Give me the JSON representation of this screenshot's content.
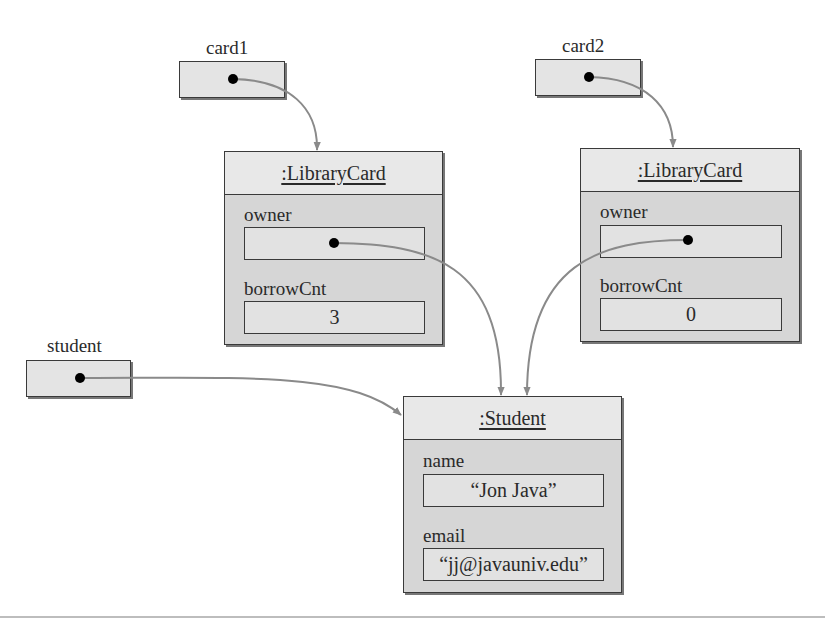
{
  "diagram": {
    "type": "UML object diagram",
    "variables": [
      {
        "id": "card1",
        "label": "card1"
      },
      {
        "id": "card2",
        "label": "card2"
      },
      {
        "id": "student",
        "label": "student"
      }
    ],
    "objects": [
      {
        "id": "librarycard1",
        "title": ":LibraryCard",
        "attributes": [
          {
            "name": "owner",
            "value": ""
          },
          {
            "name": "borrowCnt",
            "value": "3"
          }
        ]
      },
      {
        "id": "librarycard2",
        "title": ":LibraryCard",
        "attributes": [
          {
            "name": "owner",
            "value": ""
          },
          {
            "name": "borrowCnt",
            "value": "0"
          }
        ]
      },
      {
        "id": "student",
        "title": ":Student",
        "attributes": [
          {
            "name": "name",
            "value": "“Jon Java”"
          },
          {
            "name": "email",
            "value": "“jj@javauniv.edu”"
          }
        ]
      }
    ],
    "references": [
      {
        "from": "card1",
        "to": "librarycard1"
      },
      {
        "from": "card2",
        "to": "librarycard2"
      },
      {
        "from": "student",
        "to": "student-object"
      },
      {
        "from": "librarycard1.owner",
        "to": "student-object"
      },
      {
        "from": "librarycard2.owner",
        "to": "student-object"
      }
    ]
  },
  "colors": {
    "box_border": "#3a3a3a",
    "object_body": "#d6d6d6",
    "object_header": "#e8e8e8",
    "arrow": "#8a8a8a",
    "dot": "#000000"
  }
}
